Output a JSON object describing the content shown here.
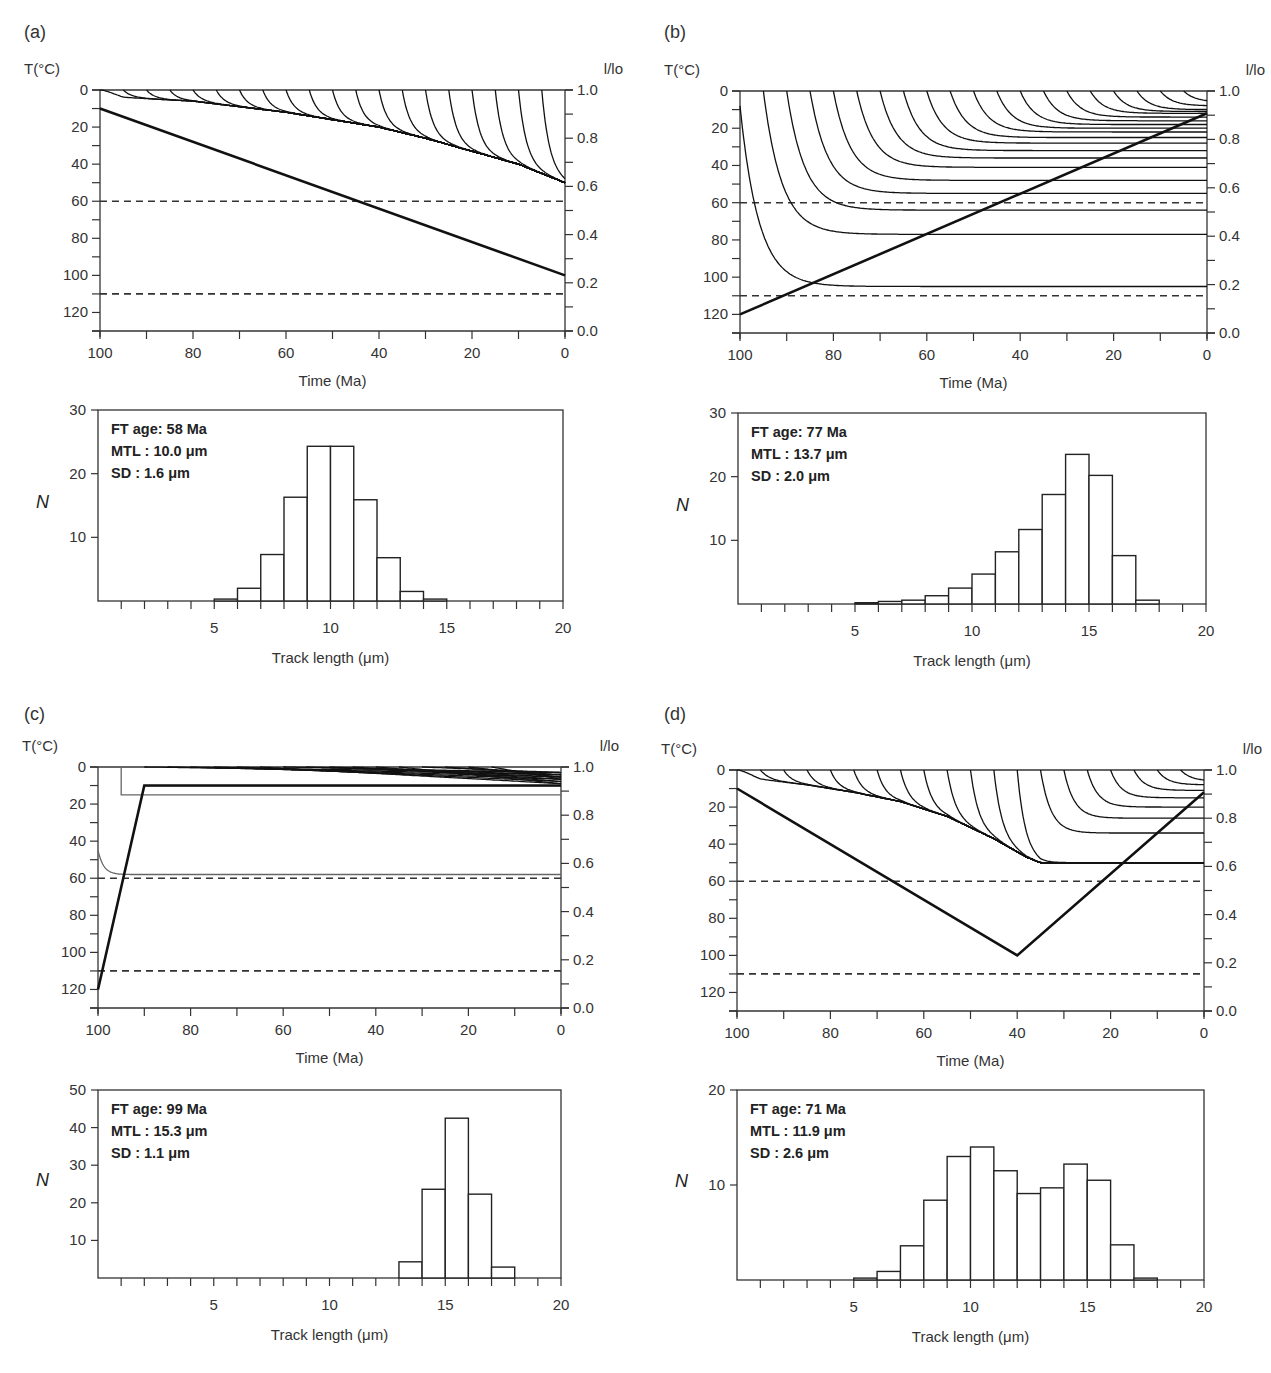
{
  "figure": {
    "panels": [
      {
        "id": "a",
        "label": "(a)",
        "stats": {
          "ft_age": "FT age: 58 Ma",
          "mtl": "MTL : 10.0 μm",
          "sd": "SD : 1.6 μm"
        }
      },
      {
        "id": "b",
        "label": "(b)",
        "stats": {
          "ft_age": "FT age: 77 Ma",
          "mtl": "MTL : 13.7 μm",
          "sd": "SD : 2.0 μm"
        }
      },
      {
        "id": "c",
        "label": "(c)",
        "stats": {
          "ft_age": "FT age: 99 Ma",
          "mtl": "MTL : 15.3 μm",
          "sd": "SD : 1.1 μm"
        }
      },
      {
        "id": "d",
        "label": "(d)",
        "stats": {
          "ft_age": "FT age: 71 Ma",
          "mtl": "MTL : 11.9 μm",
          "sd": "SD : 2.6 μm"
        }
      }
    ],
    "axis_labels": {
      "temp": "T(°C)",
      "ratio": "l/lo",
      "time": "Time (Ma)",
      "count": "N",
      "length": "Track length (μm)"
    }
  },
  "chart_data": [
    {
      "panel": "a",
      "type": "line",
      "title": "(a) Thermal history and track length reduction",
      "xlabel": "Time (Ma)",
      "ylabel": "T(°C)",
      "y2label": "l/lo",
      "xlim": [
        100,
        0
      ],
      "ylim": [
        130,
        0
      ],
      "y2lim": [
        0.0,
        1.0
      ],
      "xticks": [
        100,
        80,
        60,
        40,
        20,
        0
      ],
      "yticks": [
        0,
        20,
        40,
        60,
        80,
        100,
        120
      ],
      "y2ticks": [
        0.0,
        0.2,
        0.4,
        0.6,
        0.8,
        1.0
      ],
      "series": [
        {
          "name": "temperature path",
          "x": [
            100,
            0
          ],
          "y": [
            10,
            100
          ]
        },
        {
          "name": "PAZ upper (dashed)",
          "x": [
            100,
            0
          ],
          "y": [
            60,
            60
          ]
        },
        {
          "name": "PAZ lower (dashed)",
          "x": [
            100,
            0
          ],
          "y": [
            110,
            110
          ]
        }
      ],
      "track_envelope": {
        "x": [
          100,
          95,
          80,
          60,
          40,
          30,
          20,
          10,
          0
        ],
        "y": [
          0,
          4,
          6,
          12,
          20,
          26,
          33,
          40,
          50
        ]
      },
      "track_starts": [
        100,
        95,
        90,
        85,
        80,
        75,
        70,
        65,
        60,
        55,
        50,
        45,
        40,
        35,
        30,
        25,
        20,
        15,
        10,
        5
      ]
    },
    {
      "panel": "a",
      "type": "bar",
      "title": "(a) Track length distribution",
      "xlabel": "Track length (μm)",
      "ylabel": "N",
      "xlim": [
        0,
        20
      ],
      "ylim": [
        0,
        30
      ],
      "xticks": [
        5,
        10,
        15,
        20
      ],
      "yticks": [
        10,
        20,
        30
      ],
      "bin_edges": [
        5,
        6,
        7,
        8,
        9,
        10,
        11,
        12,
        13,
        14,
        15
      ],
      "values": [
        0.3,
        2.0,
        7.3,
        16.3,
        24.3,
        24.3,
        15.9,
        6.8,
        1.5,
        0.3
      ],
      "annotations": [
        "FT age: 58 Ma",
        "MTL : 10.0 μm",
        "SD : 1.6 μm"
      ]
    },
    {
      "panel": "b",
      "type": "line",
      "title": "(b) Thermal history and track length reduction",
      "xlabel": "Time (Ma)",
      "ylabel": "T(°C)",
      "y2label": "l/lo",
      "xlim": [
        100,
        0
      ],
      "ylim": [
        130,
        0
      ],
      "y2lim": [
        0.0,
        1.0
      ],
      "xticks": [
        100,
        80,
        60,
        40,
        20,
        0
      ],
      "yticks": [
        0,
        20,
        40,
        60,
        80,
        100,
        120
      ],
      "y2ticks": [
        0.0,
        0.2,
        0.4,
        0.6,
        0.8,
        1.0
      ],
      "series": [
        {
          "name": "temperature path",
          "x": [
            100,
            0
          ],
          "y": [
            120,
            12
          ]
        },
        {
          "name": "PAZ upper (dashed)",
          "x": [
            100,
            0
          ],
          "y": [
            60,
            60
          ]
        },
        {
          "name": "PAZ lower (dashed)",
          "x": [
            100,
            0
          ],
          "y": [
            110,
            110
          ]
        }
      ],
      "track_starts": [
        100,
        95,
        90,
        85,
        80,
        75,
        70,
        65,
        60,
        55,
        50,
        45,
        40,
        35,
        30,
        25,
        20,
        15,
        10,
        5
      ],
      "track_final_T": [
        105,
        77,
        64,
        55,
        48,
        41,
        36,
        32,
        28,
        25,
        22,
        20,
        18,
        16,
        14,
        12,
        11,
        10,
        8,
        6
      ]
    },
    {
      "panel": "b",
      "type": "bar",
      "title": "(b) Track length distribution",
      "xlabel": "Track length (μm)",
      "ylabel": "N",
      "xlim": [
        0,
        20
      ],
      "ylim": [
        0,
        30
      ],
      "xticks": [
        5,
        10,
        15,
        20
      ],
      "yticks": [
        10,
        20,
        30
      ],
      "bin_edges": [
        5,
        6,
        7,
        8,
        9,
        10,
        11,
        12,
        13,
        14,
        15,
        16,
        17,
        18
      ],
      "values": [
        0.2,
        0.4,
        0.6,
        1.3,
        2.5,
        4.7,
        8.2,
        11.7,
        17.2,
        23.5,
        20.2,
        7.6,
        0.6
      ],
      "annotations": [
        "FT age: 77 Ma",
        "MTL : 13.7 μm",
        "SD : 2.0 μm"
      ]
    },
    {
      "panel": "c",
      "type": "line",
      "title": "(c) Thermal history and track length reduction",
      "xlabel": "Time (Ma)",
      "ylabel": "T(°C)",
      "y2label": "l/lo",
      "xlim": [
        100,
        0
      ],
      "ylim": [
        130,
        0
      ],
      "y2lim": [
        0.0,
        1.0
      ],
      "xticks": [
        100,
        80,
        60,
        40,
        20,
        0
      ],
      "yticks": [
        0,
        20,
        40,
        60,
        80,
        100,
        120
      ],
      "y2ticks": [
        0.0,
        0.2,
        0.4,
        0.6,
        0.8,
        1.0
      ],
      "series": [
        {
          "name": "temperature path",
          "x": [
            100,
            90,
            0
          ],
          "y": [
            120,
            10,
            10
          ]
        },
        {
          "name": "PAZ upper (dashed)",
          "x": [
            100,
            0
          ],
          "y": [
            60,
            60
          ]
        },
        {
          "name": "PAZ lower (dashed)",
          "x": [
            100,
            0
          ],
          "y": [
            110,
            110
          ]
        },
        {
          "name": "track from 100 Ma (gray)",
          "x": [
            100,
            95,
            0
          ],
          "y": [
            45,
            58,
            58
          ]
        },
        {
          "name": "track from 95 Ma (gray)",
          "x": [
            95,
            95,
            0
          ],
          "y": [
            0,
            15,
            15
          ]
        }
      ]
    },
    {
      "panel": "c",
      "type": "bar",
      "title": "(c) Track length distribution",
      "xlabel": "Track length (μm)",
      "ylabel": "N",
      "xlim": [
        0,
        20
      ],
      "ylim": [
        0,
        50
      ],
      "xticks": [
        5,
        10,
        15,
        20
      ],
      "yticks": [
        10,
        20,
        30,
        40,
        50
      ],
      "bin_edges": [
        13,
        14,
        15,
        16,
        17,
        18
      ],
      "values": [
        4.3,
        23.6,
        42.5,
        22.3,
        2.9
      ],
      "annotations": [
        "FT age: 99 Ma",
        "MTL : 15.3 μm",
        "SD : 1.1 μm"
      ]
    },
    {
      "panel": "d",
      "type": "line",
      "title": "(d) Thermal history and track length reduction",
      "xlabel": "Time (Ma)",
      "ylabel": "T(°C)",
      "y2label": "l/lo",
      "xlim": [
        100,
        0
      ],
      "ylim": [
        130,
        0
      ],
      "y2lim": [
        0.0,
        1.0
      ],
      "xticks": [
        100,
        80,
        60,
        40,
        20,
        0
      ],
      "yticks": [
        0,
        20,
        40,
        60,
        80,
        100,
        120
      ],
      "y2ticks": [
        0.0,
        0.2,
        0.4,
        0.6,
        0.8,
        1.0
      ],
      "series": [
        {
          "name": "temperature path",
          "x": [
            100,
            40,
            0
          ],
          "y": [
            10,
            100,
            12
          ]
        },
        {
          "name": "PAZ upper (dashed)",
          "x": [
            100,
            0
          ],
          "y": [
            60,
            60
          ]
        },
        {
          "name": "PAZ lower (dashed)",
          "x": [
            100,
            0
          ],
          "y": [
            110,
            110
          ]
        }
      ],
      "track_envelope": {
        "x": [
          100,
          95,
          85,
          75,
          65,
          55,
          45,
          38,
          35,
          0
        ],
        "y": [
          0,
          5,
          8,
          12,
          17,
          25,
          37,
          47,
          50,
          50
        ]
      },
      "track_starts": [
        100,
        95,
        90,
        85,
        80,
        75,
        70,
        65,
        60,
        55,
        50,
        45,
        40,
        35,
        30,
        25,
        20,
        15,
        10,
        5
      ],
      "track_final_T_after_40Ma": [
        44,
        34,
        26,
        20,
        15,
        11,
        8,
        6
      ]
    },
    {
      "panel": "d",
      "type": "bar",
      "title": "(d) Track length distribution",
      "xlabel": "Track length (μm)",
      "ylabel": "N",
      "xlim": [
        0,
        20
      ],
      "ylim": [
        0,
        20
      ],
      "xticks": [
        5,
        10,
        15,
        20
      ],
      "yticks": [
        10,
        20
      ],
      "bin_edges": [
        5,
        6,
        7,
        8,
        9,
        10,
        11,
        12,
        13,
        14,
        15,
        16,
        17,
        18
      ],
      "values": [
        0.2,
        0.9,
        3.6,
        8.4,
        13.0,
        14.0,
        11.5,
        9.1,
        9.7,
        12.2,
        10.5,
        3.7,
        0.2
      ],
      "annotations": [
        "FT age: 71 Ma",
        "MTL : 11.9 μm",
        "SD : 2.6 μm"
      ]
    }
  ]
}
